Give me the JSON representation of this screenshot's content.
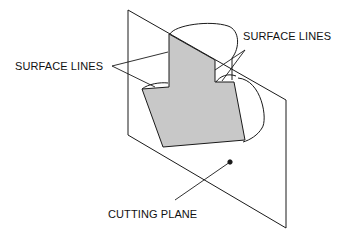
{
  "diagram": {
    "labels": {
      "surface_lines_left": "SURFACE LINES",
      "surface_lines_right": "SURFACE LINES",
      "cutting_plane": "CUTTING PLANE"
    },
    "colors": {
      "line": "#1a1a1a",
      "section_fill": "#c8c8c8",
      "background": "#ffffff"
    }
  }
}
